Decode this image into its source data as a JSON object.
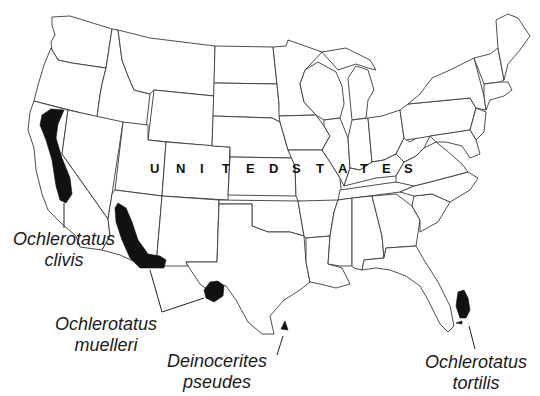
{
  "map": {
    "country_label": "UNITED STATES",
    "country_letters": [
      "U",
      "N",
      "I",
      "T",
      "E",
      "D",
      "S",
      "T",
      "A",
      "T",
      "E",
      "S"
    ],
    "fill_color": "#111111",
    "border_color": "#3a3a3a",
    "background": "#ffffff"
  },
  "species": [
    {
      "id": "clivis",
      "genus": "Ochlerotatus",
      "epithet": "clivis",
      "region": "California Central Valley / northern California"
    },
    {
      "id": "muelleri",
      "genus": "Ochlerotatus",
      "epithet": "muelleri",
      "region": "Arizona to SW New Mexico and west Texas"
    },
    {
      "id": "pseudes",
      "genus": "Deinocerites",
      "epithet": "pseudes",
      "region": "southern tip of Texas"
    },
    {
      "id": "tortilis",
      "genus": "Ochlerotatus",
      "epithet": "tortilis",
      "region": "southern Florida"
    }
  ]
}
